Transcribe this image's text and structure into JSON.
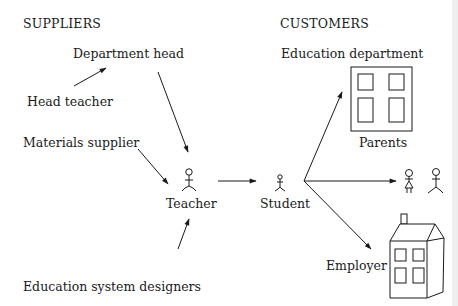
{
  "diagram": {
    "headings": {
      "suppliers": "SUPPLIERS",
      "customers": "CUSTOMERS"
    },
    "suppliers": [
      {
        "label": "Department head"
      },
      {
        "label": "Head teacher"
      },
      {
        "label": "Materials supplier"
      },
      {
        "label": "Education system designers"
      }
    ],
    "center": {
      "teacher": "Teacher",
      "student": "Student"
    },
    "customers": [
      {
        "label": "Education department"
      },
      {
        "label": "Parents"
      },
      {
        "label": "Employer"
      }
    ],
    "icons": {
      "teacher": "stick-figure-icon",
      "student": "small-stick-figure-icon",
      "education_department": "building-icon",
      "parents": "two-stick-figures-icon",
      "employer": "house-icon"
    },
    "colors": {
      "ink": "#1a1a1a",
      "background": "#ffffff"
    }
  }
}
